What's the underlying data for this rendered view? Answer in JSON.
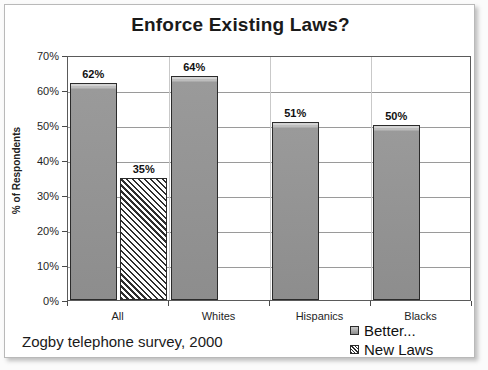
{
  "chart_data": {
    "type": "bar",
    "title": "Enforce Existing Laws?",
    "xlabel": "",
    "ylabel": "% of Respondents",
    "ylim": [
      0,
      70
    ],
    "ytick_labels": [
      "0%",
      "10%",
      "20%",
      "30%",
      "40%",
      "50%",
      "60%",
      "70%"
    ],
    "ytick_values": [
      0,
      10,
      20,
      30,
      40,
      50,
      60,
      70
    ],
    "grid": true,
    "legend_position": "bottom-right",
    "categories": [
      "All",
      "Whites",
      "Hispanics",
      "Blacks"
    ],
    "series": [
      {
        "name": "Better...",
        "style": "solid-gray",
        "values": [
          62,
          64,
          51,
          50
        ],
        "value_labels": [
          "62%",
          "64%",
          "51%",
          "50%"
        ]
      },
      {
        "name": "New Laws",
        "style": "diagonal-hatch",
        "values": [
          35,
          null,
          null,
          null
        ],
        "value_labels": [
          "35%",
          "",
          "",
          ""
        ]
      }
    ],
    "annotation": "Zogby telephone survey, 2000"
  },
  "colors": {
    "bar_fill": "#8d8d8d",
    "bar_highlight": "#d3d3d3",
    "bar_border": "#2b2b2b",
    "hatch_line": "#2f2f2f",
    "gridline": "#9a9a9a",
    "plot_border": "#5a5a5a",
    "card_border": "#b9b9b9",
    "text": "#1a1a1a"
  },
  "legend": {
    "items": [
      {
        "label": "Better...",
        "swatch": "solid-swatch"
      },
      {
        "label": "New Laws",
        "swatch": "hatched-swatch"
      }
    ]
  }
}
